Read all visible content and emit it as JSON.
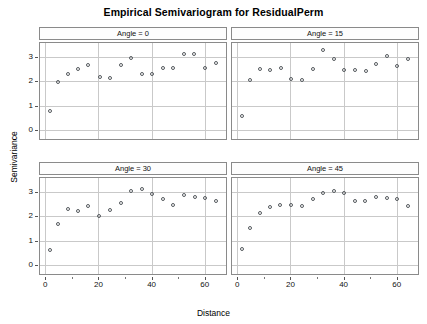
{
  "chart_data": {
    "type": "scatter",
    "title": "Empirical Semivariogram for ResidualPerm",
    "xlabel": "Distance",
    "ylabel": "Semivariance",
    "xlim": [
      -2,
      68
    ],
    "ylim": [
      -0.35,
      3.55
    ],
    "xticks": [
      0,
      20,
      40,
      60
    ],
    "yticks": [
      0,
      1,
      2,
      3
    ],
    "grid": true,
    "legend": "none",
    "layout": "2x2 lattice panels",
    "panels": [
      {
        "label": "Angle = 0",
        "row": 0,
        "col": 0,
        "points": [
          {
            "x": 1.6,
            "y": 0.8
          },
          {
            "x": 4.6,
            "y": 1.98
          },
          {
            "x": 8.4,
            "y": 2.29
          },
          {
            "x": 12.3,
            "y": 2.5
          },
          {
            "x": 16.2,
            "y": 2.66
          },
          {
            "x": 20.4,
            "y": 2.16
          },
          {
            "x": 24.2,
            "y": 2.11
          },
          {
            "x": 28.3,
            "y": 2.67
          },
          {
            "x": 32.2,
            "y": 2.95
          },
          {
            "x": 36.3,
            "y": 2.31
          },
          {
            "x": 40.2,
            "y": 2.31
          },
          {
            "x": 44.3,
            "y": 2.52
          },
          {
            "x": 48.2,
            "y": 2.55
          },
          {
            "x": 52.2,
            "y": 3.09
          },
          {
            "x": 56.1,
            "y": 3.12
          },
          {
            "x": 60.2,
            "y": 2.52
          },
          {
            "x": 64.2,
            "y": 2.75
          }
        ]
      },
      {
        "label": "Angle = 15",
        "row": 0,
        "col": 1,
        "points": [
          {
            "x": 1.6,
            "y": 0.57
          },
          {
            "x": 4.6,
            "y": 2.06
          },
          {
            "x": 8.5,
            "y": 2.5
          },
          {
            "x": 12.3,
            "y": 2.47
          },
          {
            "x": 16.3,
            "y": 2.52
          },
          {
            "x": 20.3,
            "y": 2.08
          },
          {
            "x": 24.2,
            "y": 2.06
          },
          {
            "x": 28.3,
            "y": 2.49
          },
          {
            "x": 32.3,
            "y": 3.26
          },
          {
            "x": 36.3,
            "y": 2.92
          },
          {
            "x": 40.3,
            "y": 2.47
          },
          {
            "x": 44.3,
            "y": 2.45
          },
          {
            "x": 48.3,
            "y": 2.4
          },
          {
            "x": 52.3,
            "y": 2.68
          },
          {
            "x": 56.2,
            "y": 3.04
          },
          {
            "x": 60.2,
            "y": 2.62
          },
          {
            "x": 64.2,
            "y": 2.9
          }
        ]
      },
      {
        "label": "Angle = 30",
        "row": 1,
        "col": 0,
        "points": [
          {
            "x": 1.6,
            "y": 0.64
          },
          {
            "x": 4.6,
            "y": 1.68
          },
          {
            "x": 8.4,
            "y": 2.29
          },
          {
            "x": 12.3,
            "y": 2.2
          },
          {
            "x": 16.2,
            "y": 2.41
          },
          {
            "x": 20.3,
            "y": 2.01
          },
          {
            "x": 24.2,
            "y": 2.25
          },
          {
            "x": 28.3,
            "y": 2.52
          },
          {
            "x": 32.2,
            "y": 3.04
          },
          {
            "x": 36.2,
            "y": 3.09
          },
          {
            "x": 40.2,
            "y": 2.92
          },
          {
            "x": 44.3,
            "y": 2.7
          },
          {
            "x": 48.2,
            "y": 2.45
          },
          {
            "x": 52.2,
            "y": 2.86
          },
          {
            "x": 56.2,
            "y": 2.8
          },
          {
            "x": 60.2,
            "y": 2.74
          },
          {
            "x": 64.3,
            "y": 2.62
          }
        ]
      },
      {
        "label": "Angle = 45",
        "row": 1,
        "col": 1,
        "points": [
          {
            "x": 1.6,
            "y": 0.66
          },
          {
            "x": 4.6,
            "y": 1.52
          },
          {
            "x": 8.4,
            "y": 2.13
          },
          {
            "x": 12.3,
            "y": 2.38
          },
          {
            "x": 16.2,
            "y": 2.44
          },
          {
            "x": 20.2,
            "y": 2.44
          },
          {
            "x": 24.2,
            "y": 2.43
          },
          {
            "x": 28.3,
            "y": 2.68
          },
          {
            "x": 32.2,
            "y": 2.95
          },
          {
            "x": 36.2,
            "y": 3.03
          },
          {
            "x": 40.2,
            "y": 2.93
          },
          {
            "x": 44.2,
            "y": 2.6
          },
          {
            "x": 48.2,
            "y": 2.63
          },
          {
            "x": 52.2,
            "y": 2.77
          },
          {
            "x": 56.2,
            "y": 2.73
          },
          {
            "x": 60.2,
            "y": 2.71
          },
          {
            "x": 64.3,
            "y": 2.41
          }
        ]
      }
    ]
  }
}
